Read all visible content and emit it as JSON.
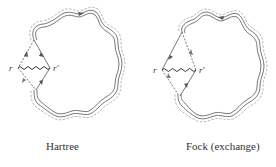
{
  "diagrams": [
    {
      "id": "hartree",
      "caption": "Hartree",
      "vertex_left_label": "r",
      "vertex_right_label": "r'"
    },
    {
      "id": "fock",
      "caption": "Fock (exchange)",
      "vertex_left_label": "r",
      "vertex_right_label": "r'"
    }
  ],
  "colors": {
    "line": "#555555",
    "dashed": "#777777",
    "text": "#333333"
  }
}
